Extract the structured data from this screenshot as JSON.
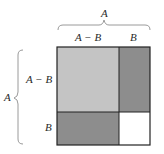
{
  "diagram": {
    "top_brace_label": "A",
    "left_brace_label": "A",
    "column_labels": [
      "A − B",
      "B"
    ],
    "row_labels": [
      "A − B",
      "B"
    ],
    "regions": [
      {
        "name": "top-left",
        "label": "(A-B)^2",
        "color": "#c4c4c4"
      },
      {
        "name": "top-right",
        "label": "(A-B)B",
        "color": "#8d8d8d"
      },
      {
        "name": "bottom-left",
        "label": "B(A-B)",
        "color": "#8d8d8d"
      },
      {
        "name": "bottom-right",
        "label": "B^2",
        "color": "#ffffff"
      }
    ],
    "colors": {
      "border": "#222222",
      "brace": "#9a9a9a",
      "text": "#2a2a2a"
    }
  }
}
